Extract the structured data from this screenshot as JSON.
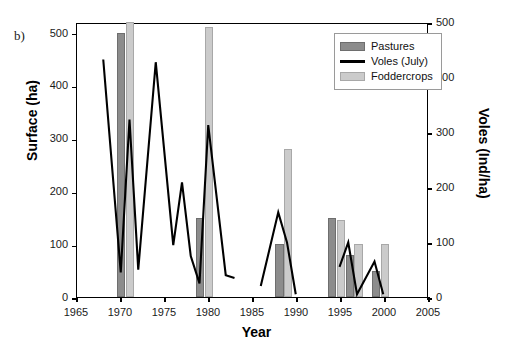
{
  "panel": {
    "label": "b)"
  },
  "legend": {
    "position": "top-right-inside",
    "items": [
      {
        "name": "Pastures",
        "marker": "bar-dark-gray-swatch",
        "color": "#8c8c8c"
      },
      {
        "name": "Voles (July)",
        "marker": "black-line-swatch",
        "color": "#000000"
      },
      {
        "name": "Foddercrops",
        "marker": "bar-light-gray-swatch",
        "color": "#cbcbcb"
      }
    ]
  },
  "chart_data": {
    "type": "bar",
    "title": "",
    "xlabel": "Year",
    "ylabel": "Surface (ha)",
    "y2label": "Voles (Ind/ha)",
    "xlim": [
      1965,
      2005
    ],
    "ylim": [
      0,
      520
    ],
    "y2lim": [
      0,
      500
    ],
    "xticks": [
      1965,
      1970,
      1975,
      1980,
      1985,
      1990,
      1995,
      2000,
      2005
    ],
    "yticks": [
      0,
      100,
      200,
      300,
      400,
      500
    ],
    "y2ticks": [
      0,
      100,
      200,
      300,
      400,
      500
    ],
    "grid": false,
    "series": [
      {
        "name": "Pastures",
        "type": "bar",
        "axis": "left",
        "unit": "ha",
        "color": "#8c8c8c",
        "points": [
          {
            "x": 1970,
            "y": 500
          },
          {
            "x": 1979,
            "y": 150
          },
          {
            "x": 1988,
            "y": 100
          },
          {
            "x": 1994,
            "y": 150
          },
          {
            "x": 1996,
            "y": 80
          },
          {
            "x": 1999,
            "y": 50
          }
        ]
      },
      {
        "name": "Foddercrops",
        "type": "bar",
        "axis": "left",
        "unit": "ha",
        "color": "#cbcbcb",
        "points": [
          {
            "x": 1971,
            "y": 520
          },
          {
            "x": 1980,
            "y": 510
          },
          {
            "x": 1989,
            "y": 280
          },
          {
            "x": 1995,
            "y": 145
          },
          {
            "x": 1997,
            "y": 100
          },
          {
            "x": 2000,
            "y": 100
          }
        ]
      },
      {
        "name": "Voles (July)",
        "type": "line",
        "axis": "right",
        "unit": "Ind/ha",
        "color": "#000000",
        "segments": [
          [
            {
              "x": 1968,
              "y": 435
            },
            {
              "x": 1970,
              "y": 45
            },
            {
              "x": 1971,
              "y": 325
            },
            {
              "x": 1972,
              "y": 50
            },
            {
              "x": 1974,
              "y": 430
            },
            {
              "x": 1976,
              "y": 95
            },
            {
              "x": 1977,
              "y": 210
            },
            {
              "x": 1978,
              "y": 75
            },
            {
              "x": 1979,
              "y": 25
            },
            {
              "x": 1980,
              "y": 315
            },
            {
              "x": 1982,
              "y": 40
            },
            {
              "x": 1983,
              "y": 35
            }
          ],
          [
            {
              "x": 1986,
              "y": 20
            },
            {
              "x": 1988,
              "y": 155
            },
            {
              "x": 1989,
              "y": 100
            },
            {
              "x": 1990,
              "y": 5
            }
          ],
          [
            {
              "x": 1995,
              "y": 55
            },
            {
              "x": 1996,
              "y": 100
            },
            {
              "x": 1997,
              "y": 5
            },
            {
              "x": 1999,
              "y": 65
            },
            {
              "x": 2000,
              "y": 5
            }
          ]
        ]
      }
    ]
  }
}
